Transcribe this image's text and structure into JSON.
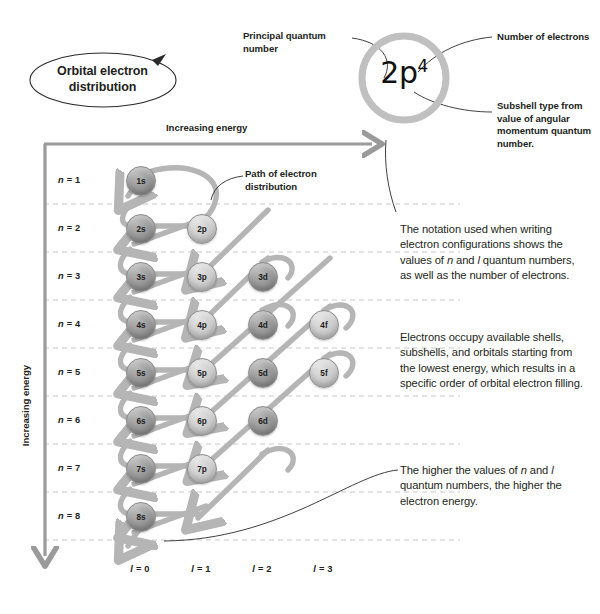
{
  "title_callout": {
    "line1": "Orbital electron",
    "line2": "distribution"
  },
  "notation": {
    "base": "2p",
    "superscript": "4",
    "full": "2p4"
  },
  "callouts": {
    "principal_quantum_number": "Principal quantum number",
    "number_of_electrons": "Number of electrons",
    "subshell_type": "Subshell type from value of angular momentum quantum number.",
    "path_of_electron_distribution": "Path of electron distribution"
  },
  "axes": {
    "horizontal_label": "Increasing energy",
    "vertical_label": "Increasing energy"
  },
  "rows": [
    {
      "label": "n = 1"
    },
    {
      "label": "n = 2"
    },
    {
      "label": "n = 3"
    },
    {
      "label": "n = 4"
    },
    {
      "label": "n = 5"
    },
    {
      "label": "n = 6"
    },
    {
      "label": "n = 7"
    },
    {
      "label": "n = 8"
    }
  ],
  "columns": [
    {
      "label": "l = 0"
    },
    {
      "label": "l = 1"
    },
    {
      "label": "l = 2"
    },
    {
      "label": "l = 3"
    }
  ],
  "orbitals": [
    {
      "label": "1s",
      "n": 1,
      "l": 0,
      "shade": "dark"
    },
    {
      "label": "2s",
      "n": 2,
      "l": 0,
      "shade": "dark"
    },
    {
      "label": "2p",
      "n": 2,
      "l": 1,
      "shade": "light"
    },
    {
      "label": "3s",
      "n": 3,
      "l": 0,
      "shade": "dark"
    },
    {
      "label": "3p",
      "n": 3,
      "l": 1,
      "shade": "light"
    },
    {
      "label": "3d",
      "n": 3,
      "l": 2,
      "shade": "dark"
    },
    {
      "label": "4s",
      "n": 4,
      "l": 0,
      "shade": "dark"
    },
    {
      "label": "4p",
      "n": 4,
      "l": 1,
      "shade": "light"
    },
    {
      "label": "4d",
      "n": 4,
      "l": 2,
      "shade": "dark"
    },
    {
      "label": "4f",
      "n": 4,
      "l": 3,
      "shade": "light"
    },
    {
      "label": "5s",
      "n": 5,
      "l": 0,
      "shade": "dark"
    },
    {
      "label": "5p",
      "n": 5,
      "l": 1,
      "shade": "light"
    },
    {
      "label": "5d",
      "n": 5,
      "l": 2,
      "shade": "dark"
    },
    {
      "label": "5f",
      "n": 5,
      "l": 3,
      "shade": "light"
    },
    {
      "label": "6s",
      "n": 6,
      "l": 0,
      "shade": "dark"
    },
    {
      "label": "6p",
      "n": 6,
      "l": 1,
      "shade": "light"
    },
    {
      "label": "6d",
      "n": 6,
      "l": 2,
      "shade": "dark"
    },
    {
      "label": "7s",
      "n": 7,
      "l": 0,
      "shade": "dark"
    },
    {
      "label": "7p",
      "n": 7,
      "l": 1,
      "shade": "light"
    },
    {
      "label": "8s",
      "n": 8,
      "l": 0,
      "shade": "dark"
    }
  ],
  "paragraphs": {
    "notation_text": "The notation used when writing electron configurations shows the values of n and l quantum numbers, as well as the number of electrons.",
    "occupy_text": "Electrons occupy available shells, subshells, and orbitals starting from the lowest energy, which results in a specific order of orbital electron filling.",
    "higher_text": "The higher the values of n and l quantum numbers, the higher the electron energy."
  },
  "colors": {
    "arrow_gray": "#b5b5b5",
    "axis_gray": "#9a9a9a",
    "dashed_gray": "#c9c9c9",
    "text_dark": "#231f20",
    "orbital_dark": "#949494",
    "orbital_light": "#cfcfcf"
  }
}
